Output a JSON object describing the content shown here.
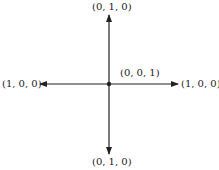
{
  "diagram": {
    "origin_label": "(0, 0, 1)",
    "top_label": "(0, 1, 0)",
    "bottom_label": "(0, 1, 0)",
    "left_label": "(1, 0, 0)",
    "right_label": "(1, 0, 0)",
    "line_color": "#222222"
  }
}
